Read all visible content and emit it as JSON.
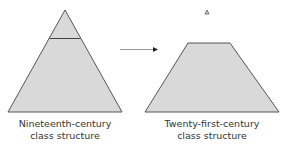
{
  "diagram": {
    "left": {
      "shape": "pyramid",
      "label_line1": "Nineteenth-century",
      "label_line2": "class structure",
      "divider": "upper-class band near apex"
    },
    "right": {
      "shape": "trapezoid",
      "label_line1": "Twenty-first-century",
      "label_line2": "class structure",
      "apex_marker": "small detached triangle above trapezoid"
    },
    "arrow": {
      "direction": "left-to-right"
    },
    "colors": {
      "fill": "#d9d9d9",
      "stroke": "#555555",
      "arrow": "#222222"
    }
  }
}
